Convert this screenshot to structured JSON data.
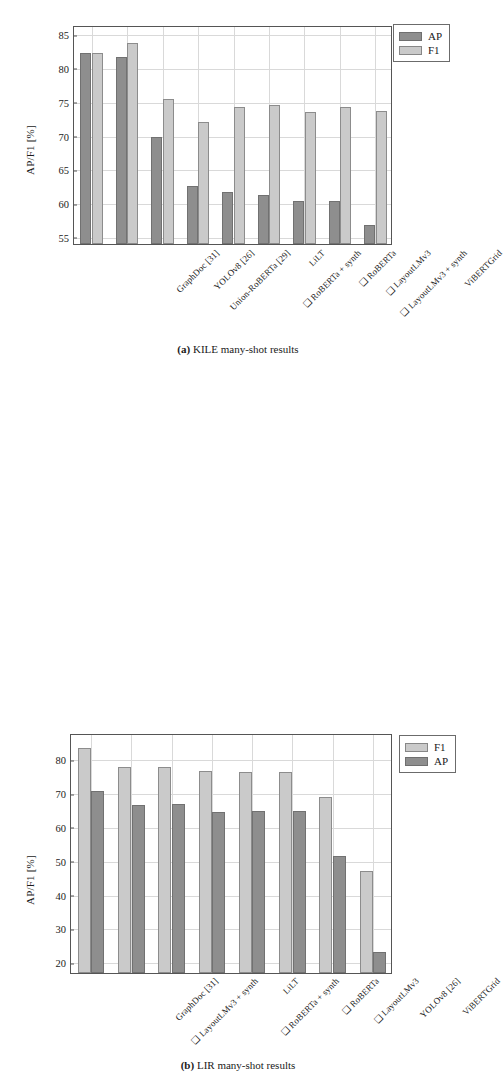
{
  "figures": [
    {
      "id": "a",
      "caption_prefix": "(a)",
      "caption_text": "KILE many-shot results",
      "ylabel": "AP/F1 [%]",
      "chart_data": {
        "type": "bar",
        "title": "(a) KILE many-shot results",
        "xlabel": "",
        "ylabel": "AP/F1 [%]",
        "ylim": [
          53.8,
          86.2
        ],
        "yticks": [
          55,
          60,
          65,
          70,
          75,
          80,
          85
        ],
        "grid": true,
        "legend_position": "outside-top-right",
        "categories": [
          "GraphDoc [31]",
          "YOLOv8 [26]",
          "Union-RoBERTa [29]",
          "LiLT",
          "❑ RoBERTa + synth",
          "❑ RoBERTa",
          "❑ LayoutLMv3",
          "❑ LayoutLMv3 + synth",
          "ViBERTGrid"
        ],
        "series": [
          {
            "name": "AP",
            "color": "#8e8e8e",
            "values": [
              82.0,
              81.5,
              69.7,
              62.4,
              61.5,
              61.0,
              60.2,
              60.1,
              56.6
            ]
          },
          {
            "name": "F1",
            "color": "#cacaca",
            "values": [
              82.0,
              83.5,
              75.3,
              71.8,
              74.1,
              74.3,
              73.4,
              74.0,
              73.5
            ]
          }
        ]
      }
    },
    {
      "id": "b",
      "caption_prefix": "(b)",
      "caption_text": "LIR many-shot results",
      "ylabel": "AP/F1 [%]",
      "chart_data": {
        "type": "bar",
        "title": "(b) LIR many-shot results",
        "xlabel": "",
        "ylabel": "AP/F1 [%]",
        "ylim": [
          16.5,
          87.5
        ],
        "yticks": [
          20,
          30,
          40,
          50,
          60,
          70,
          80
        ],
        "grid": true,
        "legend_position": "outside-top-right",
        "categories": [
          "GraphDoc [31]",
          "❑ LayoutLMv3 + synth",
          "LiLT",
          "❑ RoBERTa + synth",
          "❑ RoBERTa",
          "❑ LayoutLMv3",
          "YOLOv8 [26]",
          "ViBERTGrid"
        ],
        "series": [
          {
            "name": "F1",
            "color": "#cacaca",
            "values": [
              83.2,
              77.5,
              77.3,
              76.3,
              76.0,
              76.0,
              68.6,
              46.7
            ]
          },
          {
            "name": "AP",
            "color": "#8e8e8e",
            "values": [
              70.2,
              66.3,
              66.4,
              64.1,
              64.5,
              64.3,
              51.2,
              22.7
            ]
          }
        ]
      }
    }
  ]
}
